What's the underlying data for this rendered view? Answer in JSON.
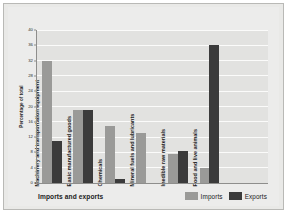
{
  "chart_data": {
    "type": "bar",
    "title": "Imports and exports",
    "xlabel": "Imports and exports",
    "ylabel": "Percentage of total",
    "ylim": [
      0,
      40
    ],
    "yticks": [
      0,
      4,
      8,
      12,
      16,
      20,
      24,
      28,
      32,
      36,
      40
    ],
    "grid": true,
    "legend_position": "bottom-right",
    "categories": [
      "Machinery and transportation equipment",
      "Basic manufactured goods",
      "Chemicals",
      "Mineral fuels and lubricants",
      "Inedible raw materials",
      "Food and live animals"
    ],
    "series": [
      {
        "name": "Imports",
        "color": "#9a9a98",
        "values": [
          32,
          19,
          15,
          13,
          7.5,
          4
        ]
      },
      {
        "name": "Exports",
        "color": "#3b3b3b",
        "values": [
          11,
          19,
          1,
          0,
          8.5,
          36
        ]
      }
    ]
  },
  "axis": {
    "y_title": "Percentage of total",
    "tick_labels": [
      "0",
      "4",
      "8",
      "12",
      "16",
      "20",
      "24",
      "28",
      "32",
      "36",
      "40"
    ]
  },
  "legend": {
    "items": [
      {
        "label": "Imports",
        "color": "#9a9a98"
      },
      {
        "label": "Exports",
        "color": "#3b3b3b"
      }
    ]
  },
  "footer": {
    "title": "Imports and exports"
  },
  "colors": {
    "imports": "#9a9a98",
    "exports": "#3b3b3b",
    "plot_background": "#e2e2e0",
    "panel_background": "#ececeb",
    "gridline": "#fbfbfa"
  }
}
